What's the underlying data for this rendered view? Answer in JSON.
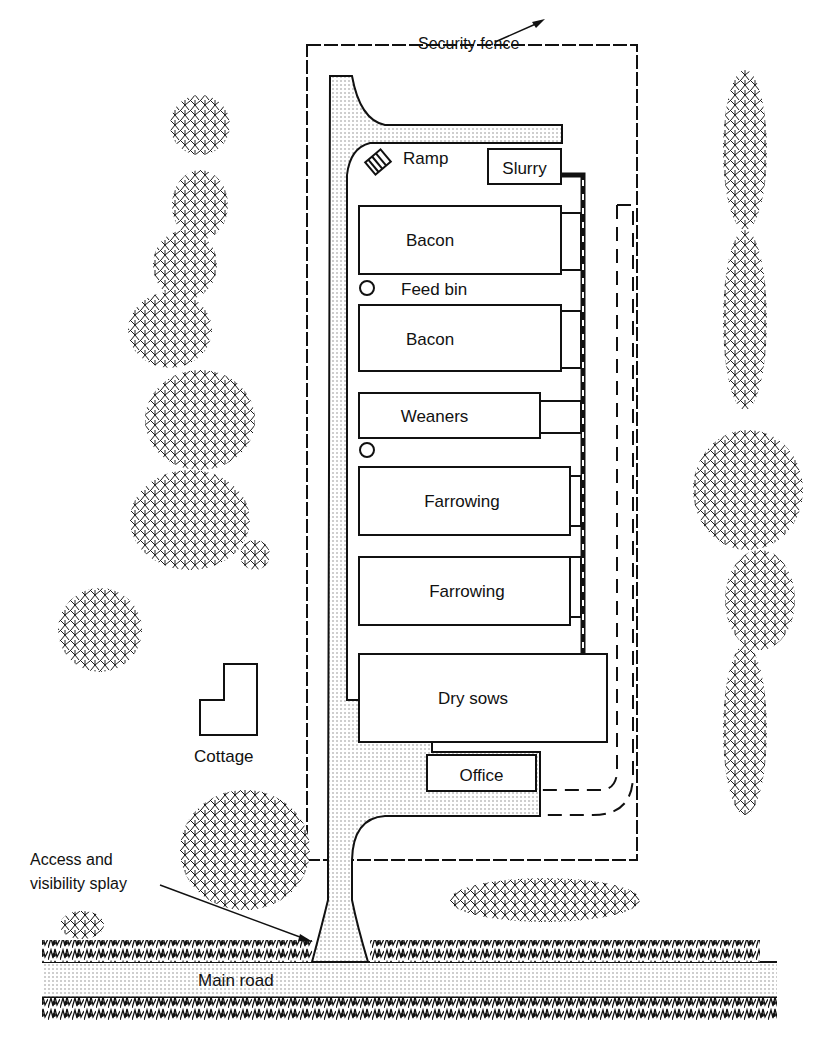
{
  "diagram": {
    "type": "site-plan",
    "colors": {
      "ink": "#111111",
      "paper": "#ffffff",
      "stipple": "#bdbdbd"
    },
    "labels": {
      "security_fence": "Security fence",
      "ramp": "Ramp",
      "slurry": "Slurry",
      "feed_bin": "Feed bin",
      "cottage": "Cottage",
      "office": "Office",
      "access_splay": "Access and",
      "access_splay_2": "visibility splay",
      "main_road": "Main road"
    },
    "buildings": [
      {
        "id": "bacon-1",
        "label": "Bacon"
      },
      {
        "id": "bacon-2",
        "label": "Bacon"
      },
      {
        "id": "weaners",
        "label": "Weaners"
      },
      {
        "id": "farrowing-1",
        "label": "Farrowing"
      },
      {
        "id": "farrowing-2",
        "label": "Farrowing"
      },
      {
        "id": "dry-sows",
        "label": "Dry sows"
      }
    ]
  }
}
